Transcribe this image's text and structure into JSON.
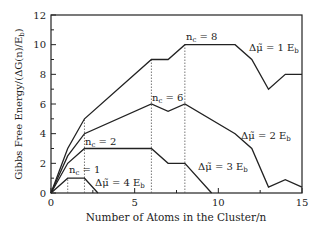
{
  "chart_data": {
    "type": "line",
    "title": "",
    "xlabel": "Number of Atoms in the Cluster/n",
    "ylabel": "Gibbs Free Energy/(ΔG(n)/E_b)",
    "xlim": [
      0,
      15
    ],
    "ylim": [
      0,
      12
    ],
    "xticks": [
      0,
      5,
      10,
      15
    ],
    "yticks": [
      0,
      2,
      4,
      6,
      8,
      10,
      12
    ],
    "grid": false,
    "series": [
      {
        "name": "Δμ̃ = 1 E_b",
        "critical_n": 8,
        "critical_label": "n_c = 8",
        "x": [
          0,
          1,
          2,
          6,
          7,
          8,
          10,
          11,
          12,
          13,
          14,
          15
        ],
        "y": [
          0,
          3,
          5,
          9,
          9,
          10,
          10,
          10,
          9,
          7,
          8,
          8
        ]
      },
      {
        "name": "Δμ̃ = 2 E_b",
        "critical_n": 6,
        "critical_label": "n_c = 6",
        "x": [
          0,
          1,
          2,
          6,
          7,
          8,
          11,
          12,
          13,
          14,
          15
        ],
        "y": [
          0,
          2.5,
          4,
          6,
          5.5,
          6,
          4,
          3,
          0.4,
          0.9,
          0.4
        ]
      },
      {
        "name": "Δμ̃ = 3 E_b",
        "critical_n": 2,
        "critical_label": "n_c = 2",
        "x": [
          0,
          1,
          2,
          6,
          7,
          8,
          9.6
        ],
        "y": [
          0,
          2,
          3,
          3,
          2,
          2,
          0
        ]
      },
      {
        "name": "Δμ̃ = 4 E_b",
        "critical_n": 1,
        "critical_label": "n_c = 1",
        "x": [
          0,
          1,
          2,
          2.8
        ],
        "y": [
          0,
          1,
          1,
          0
        ]
      }
    ],
    "annotations": [
      {
        "text": "n_c = 8",
        "x": 8,
        "y": 10
      },
      {
        "text": "n_c = 6",
        "x": 6,
        "y": 6
      },
      {
        "text": "n_c = 2",
        "x": 2,
        "y": 3
      },
      {
        "text": "n_c = 1",
        "x": 1,
        "y": 1
      },
      {
        "text": "Δμ̃ = 1 E_b",
        "x": 11,
        "y": 10
      },
      {
        "text": "Δμ̃ = 2 E_b",
        "x": 12,
        "y": 6
      },
      {
        "text": "Δμ̃ = 3 E_b",
        "x": 8,
        "y": 2
      },
      {
        "text": "Δμ̃ = 4 E_b",
        "x": 2,
        "y": 1
      }
    ],
    "dashed_verticals": [
      1,
      2,
      6,
      8
    ]
  },
  "labels": {
    "xlabel": "Number of Atoms in the Cluster/n",
    "ylabel_main": "Gibbs Free Energy/(ΔG(n)/E",
    "ylabel_sub": "b",
    "ylabel_end": ")",
    "nc8": "n",
    "nc8_sub": "c",
    "nc8_val": " = 8",
    "nc6_val": " = 6",
    "nc2_val": " = 2",
    "nc1_val": " = 1",
    "mu1": "Δμ̃ = 1 E",
    "mu2": "Δμ̃ = 2 E",
    "mu3": "Δμ̃ = 3 E",
    "mu4": "Δμ̃ = 4 E",
    "b": "b",
    "n": "n",
    "c": "c"
  },
  "ticks": {
    "x": [
      "0",
      "5",
      "10",
      "15"
    ],
    "y": [
      "0",
      "2",
      "4",
      "6",
      "8",
      "10",
      "12"
    ]
  }
}
